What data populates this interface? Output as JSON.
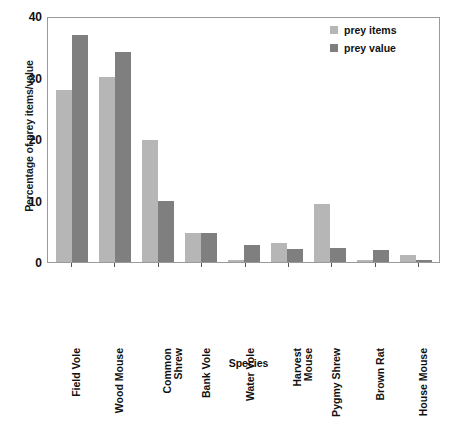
{
  "chart_data": {
    "type": "bar",
    "title": "",
    "xlabel": "Species",
    "ylabel": "Percentage of prey items/value",
    "ylim": [
      0,
      40
    ],
    "yticks": [
      0,
      10,
      20,
      30,
      40
    ],
    "grid": false,
    "legend_position": "top-right",
    "categories": [
      "Field Vole",
      "Common Shrew",
      "Wood Mouse",
      "Bank Vole",
      "Water Vole",
      "Harvest Mouse",
      "Pygmy Shrew",
      "Brown Rat",
      "House Mouse"
    ],
    "category_lines": [
      [
        "Field Vole"
      ],
      [
        "Wood Mouse"
      ],
      [
        "Common",
        "Shrew"
      ],
      [
        "Bank Vole"
      ],
      [
        "Water Vole"
      ],
      [
        "Harvest",
        "Mouse"
      ],
      [
        "Pygmy Shrew"
      ],
      [
        "Brown Rat"
      ],
      [
        "House Mouse"
      ]
    ],
    "ordered_categories": [
      "Field Vole",
      "Wood Mouse",
      "Common Shrew",
      "Bank Vole",
      "Water Vole",
      "Harvest Mouse",
      "Pygmy Shrew",
      "Brown Rat",
      "House Mouse"
    ],
    "series": [
      {
        "name": "prey items",
        "color": "#b6b6b6",
        "values": [
          28.2,
          30.3,
          20.0,
          4.8,
          0.3,
          3.1,
          9.5,
          0.3,
          1.2
        ]
      },
      {
        "name": "prey value",
        "color": "#7f7f7f",
        "values": [
          37.2,
          34.5,
          10.0,
          4.8,
          2.8,
          2.2,
          2.3,
          2.0,
          0.3
        ]
      }
    ]
  },
  "legend": {
    "items_label": "prey items",
    "value_label": "prey value"
  },
  "axes": {
    "y_title": "Percentage of prey items/value",
    "x_title": "Species",
    "y_tick_0": "0",
    "y_tick_10": "10",
    "y_tick_20": "20",
    "y_tick_30": "30",
    "y_tick_40": "40"
  },
  "colors": {
    "prey_items": "#b6b6b6",
    "prey_value": "#7f7f7f",
    "axis": "#9a9a9a",
    "text": "#111111",
    "background": "#ffffff"
  }
}
